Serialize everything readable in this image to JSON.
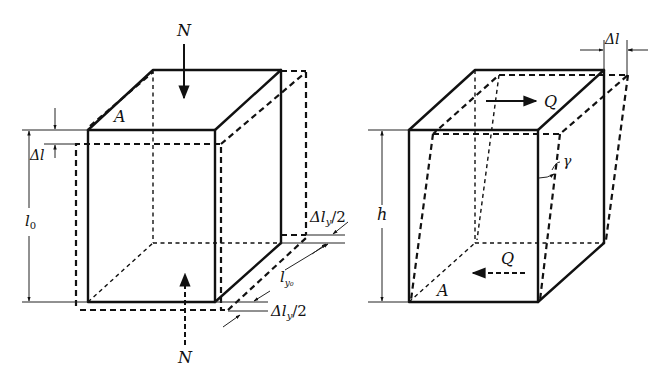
{
  "figure": {
    "panels": [
      {
        "id": "axial",
        "labels": {
          "force_top": "N",
          "force_bottom": "N",
          "area": "A",
          "delta_l": "Δl",
          "length": "l",
          "length_sub": "0",
          "lateral_top": "Δl",
          "lateral_top_sub": "y",
          "lateral_top_suffix": "/2",
          "lateral_length": "l",
          "lateral_length_sub": "y₀",
          "lateral_bottom": "Δl",
          "lateral_bottom_sub": "y",
          "lateral_bottom_suffix": "/2"
        }
      },
      {
        "id": "shear",
        "labels": {
          "force_top": "Q",
          "force_bottom": "Q",
          "area": "A",
          "delta_l": "Δl",
          "height": "h",
          "angle": "γ"
        }
      }
    ],
    "colors": {
      "ink": "#111111",
      "background": "#ffffff"
    }
  }
}
